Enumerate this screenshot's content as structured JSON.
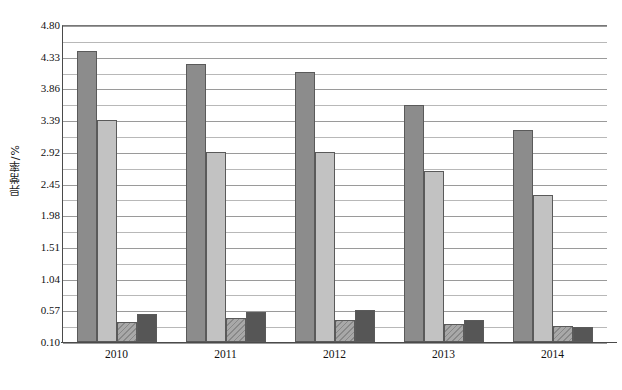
{
  "chart_data": {
    "type": "bar",
    "title": "",
    "xlabel": "",
    "ylabel": "异常率/%",
    "categories": [
      "2010",
      "2011",
      "2012",
      "2013",
      "2014"
    ],
    "ylim": [
      0.1,
      4.8
    ],
    "ytick_labels": [
      "0.10",
      "0.57",
      "1.04",
      "1.51",
      "1.98",
      "2.45",
      "2.92",
      "3.39",
      "3.86",
      "4.33",
      "4.80"
    ],
    "ytick_values": [
      0.1,
      0.57,
      1.04,
      1.51,
      1.98,
      2.45,
      2.92,
      3.39,
      3.86,
      4.33,
      4.8
    ],
    "ytick_interval": 0.47,
    "grid": true,
    "minor_grid": true,
    "legend": "none",
    "legend_position": "none",
    "bars_per_group": 4,
    "series": [
      {
        "name": "series-1",
        "color": "#8c8c8c",
        "values": [
          4.42,
          4.22,
          4.1,
          3.62,
          3.24
        ]
      },
      {
        "name": "series-2",
        "color": "#c2c2c2",
        "values": [
          3.39,
          2.92,
          2.92,
          2.63,
          2.28
        ]
      },
      {
        "name": "series-3",
        "color": "#a8a8a8",
        "values": [
          0.4,
          0.46,
          0.43,
          0.36,
          0.34
        ]
      },
      {
        "name": "series-4",
        "color": "#565656",
        "values": [
          0.52,
          0.55,
          0.58,
          0.42,
          0.33
        ]
      }
    ]
  },
  "axis": {
    "y_title": "异常率/%"
  }
}
